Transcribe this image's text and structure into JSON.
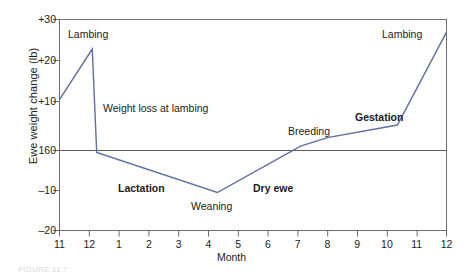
{
  "figure": {
    "caption": "FIGURE 11.7"
  },
  "axes": {
    "ylabel": "Ewe weight change (lb)",
    "xlabel": "Month",
    "yticks": [
      {
        "label": "+30",
        "value": 30
      },
      {
        "label": "+20",
        "value": 20
      },
      {
        "label": "+10",
        "value": 10
      },
      {
        "label": "160",
        "value": 0
      },
      {
        "label": "–10",
        "value": -10
      },
      {
        "label": "–20",
        "value": -20
      }
    ],
    "xticks": [
      "11",
      "12",
      "1",
      "2",
      "3",
      "4",
      "5",
      "6",
      "7",
      "8",
      "9",
      "10",
      "11",
      "12"
    ]
  },
  "annotations": [
    {
      "text": "Lambing",
      "x": 68,
      "y": 28,
      "bold": false,
      "name": "annotation-lambing-start"
    },
    {
      "text": "Weight loss at lambing",
      "x": 103,
      "y": 102,
      "bold": false,
      "name": "annotation-weight-loss-at-lambing"
    },
    {
      "text": "Lactation",
      "x": 118,
      "y": 182,
      "bold": true,
      "name": "annotation-lactation"
    },
    {
      "text": "Weaning",
      "x": 191,
      "y": 200,
      "bold": false,
      "name": "annotation-weaning"
    },
    {
      "text": "Dry ewe",
      "x": 253,
      "y": 182,
      "bold": true,
      "name": "annotation-dry-ewe"
    },
    {
      "text": "Breeding",
      "x": 288,
      "y": 125,
      "bold": false,
      "name": "annotation-breeding"
    },
    {
      "text": "Gestation",
      "x": 355,
      "y": 111,
      "bold": true,
      "name": "annotation-gestation"
    },
    {
      "text": "Lambing",
      "x": 382,
      "y": 28,
      "bold": false,
      "name": "annotation-lambing-end"
    }
  ],
  "colors": {
    "line": "#5f6f9e",
    "frame": "#6d6d6d",
    "baseline": "#5a5a5a",
    "text": "#1b1b1b"
  },
  "chart_data": {
    "type": "line",
    "title": "",
    "xlabel": "Month",
    "ylabel": "Ewe weight change (lb)",
    "xlim": [
      0,
      13
    ],
    "ylim": [
      -20,
      30
    ],
    "grid": false,
    "legend": "none",
    "baseline_value": 0,
    "baseline_label": "160",
    "x_categories": [
      "11",
      "12",
      "1",
      "2",
      "3",
      "4",
      "5",
      "6",
      "7",
      "8",
      "9",
      "10",
      "11",
      "12"
    ],
    "series": [
      {
        "name": "Ewe weight change",
        "points": [
          {
            "month": "11",
            "x": 0,
            "y": 11
          },
          {
            "month": "12",
            "x": 1.1,
            "y": 23
          },
          {
            "month": "12",
            "x": 1.25,
            "y": -1.5
          },
          {
            "month": "4",
            "x": 5.3,
            "y": -11
          },
          {
            "month": "7",
            "x": 8.1,
            "y": 0
          },
          {
            "month": "8",
            "x": 9,
            "y": 2
          },
          {
            "month": "10",
            "x": 11.35,
            "y": 5
          },
          {
            "month": "12",
            "x": 13,
            "y": 27
          }
        ]
      }
    ]
  }
}
